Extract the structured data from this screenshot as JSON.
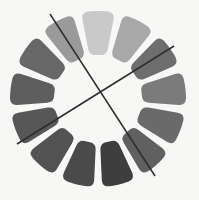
{
  "figure": {
    "name": "segmented-grayscale-ring-with-crossing-axes",
    "background_color": "#f7f7f6",
    "width": 199,
    "height": 200
  },
  "ring": {
    "center_x": 98,
    "center_y": 99,
    "inner_radius": 44,
    "outer_radius": 88,
    "segment_count": 13,
    "segment_gap_degrees": 5.5,
    "corner_radius": 7,
    "start_angle_degrees": -90,
    "segments": [
      {
        "index": 0,
        "angle_degrees": -90,
        "color": "#c9c9c9",
        "label": "segment-1"
      },
      {
        "index": 1,
        "angle_degrees": -62.3,
        "color": "#a8a8a8",
        "label": "segment-2"
      },
      {
        "index": 2,
        "angle_degrees": -34.6,
        "color": "#6e6e6e",
        "label": "segment-3"
      },
      {
        "index": 3,
        "angle_degrees": -6.9,
        "color": "#7b7b7b",
        "label": "segment-4"
      },
      {
        "index": 4,
        "angle_degrees": 20.8,
        "color": "#6a6a6a",
        "label": "segment-5"
      },
      {
        "index": 5,
        "angle_degrees": 48.5,
        "color": "#606060",
        "label": "segment-6"
      },
      {
        "index": 6,
        "angle_degrees": 76.2,
        "color": "#3e3e3e",
        "label": "segment-7"
      },
      {
        "index": 7,
        "angle_degrees": 103.8,
        "color": "#4a4a4a",
        "label": "segment-8"
      },
      {
        "index": 8,
        "angle_degrees": 131.5,
        "color": "#525252",
        "label": "segment-9"
      },
      {
        "index": 9,
        "angle_degrees": 159.2,
        "color": "#575757",
        "label": "segment-10"
      },
      {
        "index": 10,
        "angle_degrees": 186.9,
        "color": "#5e5e5e",
        "label": "segment-11"
      },
      {
        "index": 11,
        "angle_degrees": 214.6,
        "color": "#676767",
        "label": "segment-12"
      },
      {
        "index": 12,
        "angle_degrees": 242.3,
        "color": "#9a9a9a",
        "label": "segment-13"
      }
    ]
  },
  "axes": {
    "color": "#2e2e2e",
    "width": 1.5,
    "lines": [
      {
        "name": "steep-axis",
        "x1": 50,
        "y1": 14,
        "x2": 155,
        "y2": 176
      },
      {
        "name": "shallow-axis",
        "x1": 17,
        "y1": 144,
        "x2": 174,
        "y2": 46
      }
    ]
  }
}
